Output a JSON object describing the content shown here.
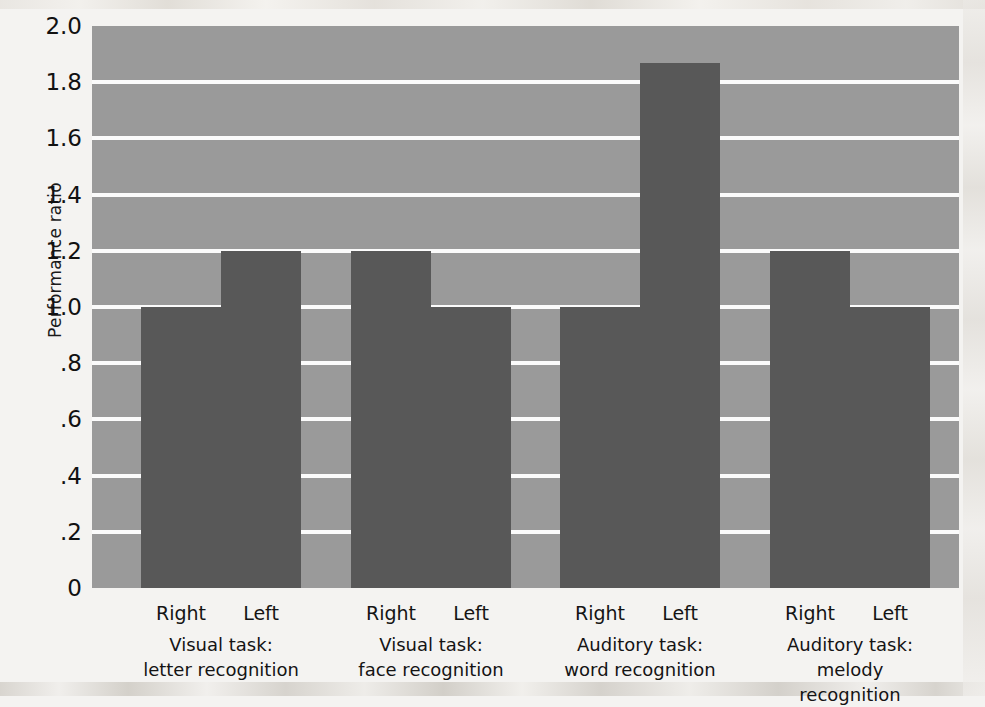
{
  "chart_data": {
    "type": "bar",
    "title": "",
    "subtitle": "",
    "xlabel": "",
    "ylabel": "Performance ratio",
    "ylim": [
      0,
      2.0
    ],
    "ytick_labels": [
      "2.0",
      "1.8",
      "1.6",
      "1.4",
      "1.2",
      "1.0",
      ".8",
      ".6",
      ".4",
      ".2",
      "0"
    ],
    "ytick_values": [
      2.0,
      1.8,
      1.6,
      1.4,
      1.2,
      1.0,
      0.8,
      0.6,
      0.4,
      0.2,
      0
    ],
    "grid": true,
    "legend": "none",
    "categories": [
      "Visual task: letter recognition",
      "Visual task: face recognition",
      "Auditory task: word recognition",
      "Auditory task: melody recognition"
    ],
    "series": [
      {
        "name": "Right",
        "values": [
          1.0,
          1.2,
          1.0,
          1.2
        ]
      },
      {
        "name": "Left",
        "values": [
          1.2,
          1.0,
          1.87,
          1.0
        ]
      }
    ],
    "bar_color": "#585858",
    "plot_background": "#9a9a9a",
    "gridline_color": "#fbfbfb",
    "page_background": "#f4f3f1"
  },
  "groups": [
    {
      "caption_line1": "Visual task:",
      "caption_line2": "letter recognition",
      "bars": [
        {
          "label": "Right",
          "value": 1.0
        },
        {
          "label": "Left",
          "value": 1.2
        }
      ]
    },
    {
      "caption_line1": "Visual task:",
      "caption_line2": "face recognition",
      "bars": [
        {
          "label": "Right",
          "value": 1.2
        },
        {
          "label": "Left",
          "value": 1.0
        }
      ]
    },
    {
      "caption_line1": "Auditory task:",
      "caption_line2": "word recognition",
      "bars": [
        {
          "label": "Right",
          "value": 1.0
        },
        {
          "label": "Left",
          "value": 1.87
        }
      ]
    },
    {
      "caption_line1": "Auditory task:",
      "caption_line2": "melody recognition",
      "bars": [
        {
          "label": "Right",
          "value": 1.2
        },
        {
          "label": "Left",
          "value": 1.0
        }
      ]
    }
  ],
  "axis": {
    "y_title": "Performance ratio"
  }
}
